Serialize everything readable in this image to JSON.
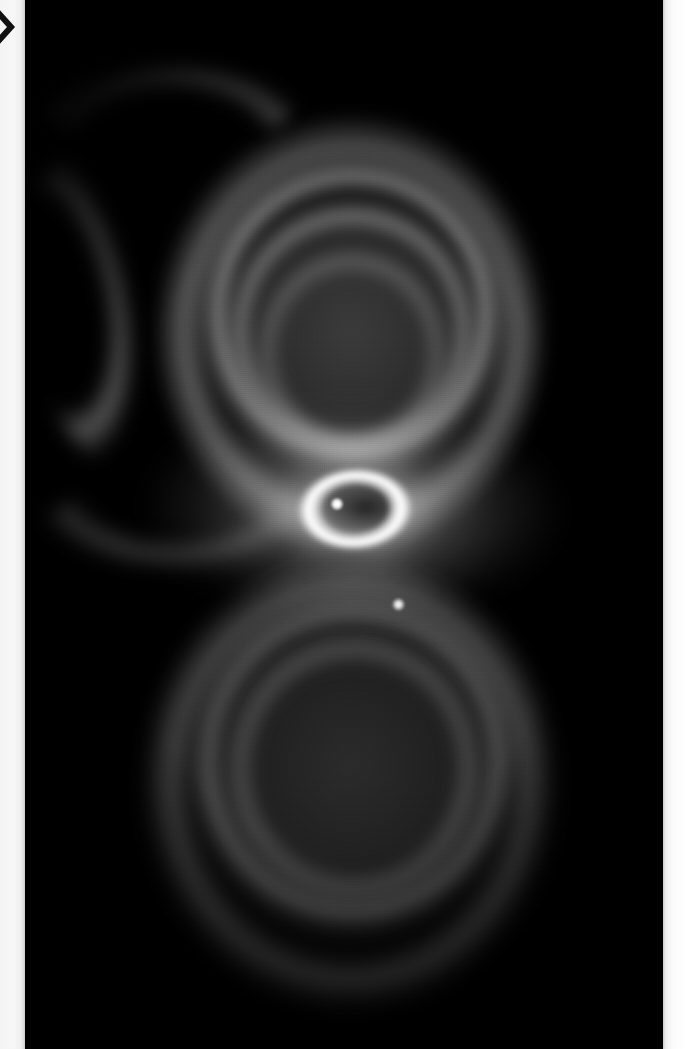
{
  "viewer": {
    "prev_icon": "chevron-right-icon",
    "gutter_color": "#f4f4f4",
    "plate_background": "#000000"
  },
  "image": {
    "subject": "Hourglass Nebula",
    "rendering": "grayscale",
    "alt": "Grayscale astronomical photograph of the Hourglass Nebula: two nested bipolar lobes etched with concentric rings, a brilliant elliptical ring at the waist containing a central star, and a small companion star point below the waist.",
    "features": {
      "upper_lobe": "upper-lobe",
      "lower_lobe": "lower-lobe",
      "inner_ring": "inner-bright-ring",
      "central_star": "central-star",
      "companion_star": "companion-star"
    },
    "colors": {
      "background": "#000000",
      "nebula_mid": "#6e6e6e",
      "ring_bright": "#ffffff",
      "star": "#ffffff"
    }
  }
}
